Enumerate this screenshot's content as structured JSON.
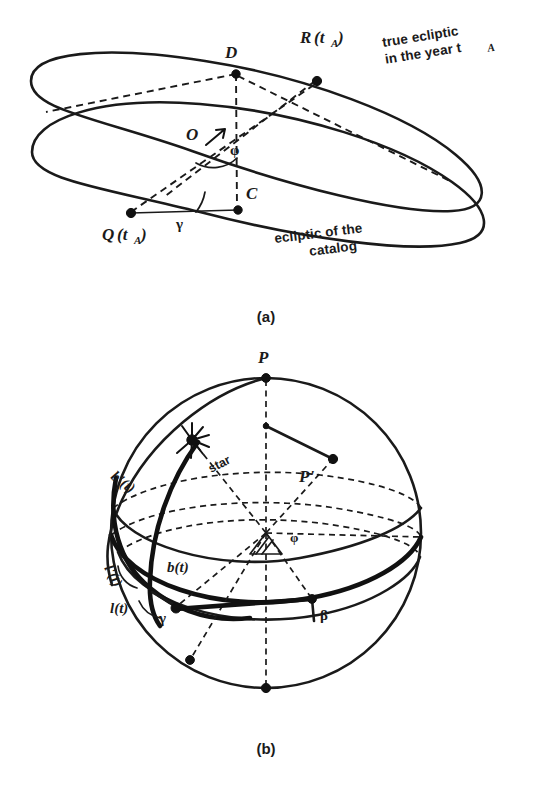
{
  "figure": {
    "background_color": "#ffffff",
    "ink_color": "#1a1a1a",
    "panels": [
      {
        "id": "a",
        "caption": "(a)"
      },
      {
        "id": "b",
        "caption": "(b)"
      }
    ]
  },
  "panel_a": {
    "caption": "(a)",
    "description": "Two intersecting tilted ellipses representing the true ecliptic of year t_A and the ecliptic of the catalog, with center O and nodes C and D.",
    "annotations": {
      "true_ecliptic_line1": "true ecliptic",
      "true_ecliptic_line2": "in the  year t",
      "true_ecliptic_sub": "A",
      "catalog_ecliptic_line1": "ecliptic of the",
      "catalog_ecliptic_line2": "catalog"
    },
    "points": [
      {
        "name": "D",
        "label": "D",
        "x": 236,
        "y": 73
      },
      {
        "name": "C",
        "label": "C",
        "x": 237,
        "y": 208
      },
      {
        "name": "O",
        "label": "O",
        "x": 214,
        "y": 133
      },
      {
        "name": "R",
        "label": "R",
        "arg": "(t",
        "sub": "A",
        "argclose": ")",
        "x": 317,
        "y": 80
      },
      {
        "name": "Q",
        "label": "Q",
        "arg": "(t",
        "sub": "A",
        "argclose": ")",
        "x": 131,
        "y": 212
      }
    ],
    "angles": [
      {
        "name": "phi",
        "label": "φ"
      },
      {
        "name": "gamma",
        "label": "γ"
      }
    ]
  },
  "panel_b": {
    "caption": "(b)",
    "description": "Celestial sphere with pole P, catalog pole P-prime, a star, and great circles marking ecliptic longitude and latitude.",
    "labels": {
      "pole": "P",
      "pole_prime": "P'",
      "star": "star",
      "b_prime_t": "b'(t)",
      "b_t": "b(t)",
      "l_prime_t": "l'(t)",
      "l_t": "l(t)",
      "gamma": "γ",
      "beta": "β",
      "phi": "φ"
    },
    "sphere": {
      "center_x": 266,
      "center_y": 533,
      "radius": 155
    }
  }
}
